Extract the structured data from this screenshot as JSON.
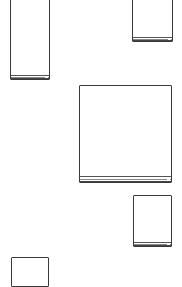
{
  "canvas": {
    "width": 182,
    "height": 278,
    "background": "#ffffff"
  },
  "stroke_color": "#3a3a3a",
  "shapes": [
    {
      "id": "box-1",
      "kind": "rectangle-with-base",
      "x": 10,
      "y": -2,
      "w": 40,
      "h": 82,
      "base_h": 4
    },
    {
      "id": "box-2",
      "kind": "rectangle-with-base",
      "x": 132,
      "y": -2,
      "w": 41,
      "h": 44,
      "base_h": 4
    },
    {
      "id": "box-3",
      "kind": "rectangle-with-base",
      "x": 79,
      "y": 85,
      "w": 93,
      "h": 98,
      "base_h": 6
    },
    {
      "id": "box-4",
      "kind": "rectangle-with-base",
      "x": 133,
      "y": 195,
      "w": 39,
      "h": 52,
      "base_h": 4
    },
    {
      "id": "box-5",
      "kind": "rectangle-with-base",
      "x": 11,
      "y": 257,
      "w": 38,
      "h": 30,
      "base_h": 0
    }
  ]
}
